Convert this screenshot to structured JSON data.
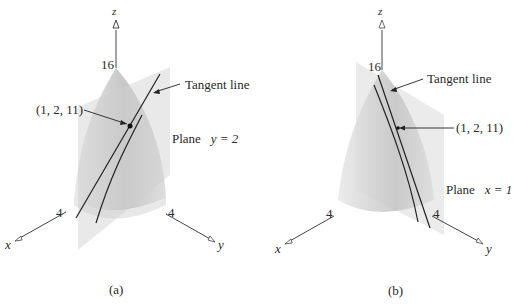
{
  "panels": [
    {
      "id": "a",
      "caption": "(a)",
      "axis_labels": {
        "z": "z",
        "x": "x",
        "y": "y"
      },
      "tick_labels": {
        "z": "16",
        "x": "4",
        "y": "4"
      },
      "tangent_label": "Tangent line",
      "point_label": "(1, 2, 11)",
      "plane_word": "Plane",
      "plane_eq": "y = 2"
    },
    {
      "id": "b",
      "caption": "(b)",
      "axis_labels": {
        "z": "z",
        "x": "x",
        "y": "y"
      },
      "tick_labels": {
        "z": "16",
        "x": "4",
        "y": "4"
      },
      "tangent_label": "Tangent line",
      "point_label": "(1, 2, 11)",
      "plane_word": "Plane",
      "plane_eq": "x = 1"
    }
  ]
}
